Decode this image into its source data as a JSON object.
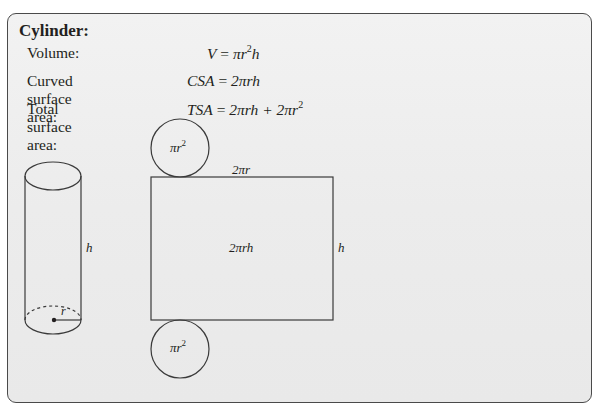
{
  "title": "Cylinder:",
  "formulas": [
    {
      "label": "Volume:",
      "lhs": "V",
      "eq": " = ",
      "rhs_a": "πr",
      "sup": "2",
      "rhs_b": "h",
      "tail": "",
      "tail_sup": ""
    },
    {
      "label": "Curved surface area:",
      "lhs": "CSA",
      "eq": " = ",
      "rhs_a": "2πrh",
      "sup": "",
      "rhs_b": "",
      "tail": "",
      "tail_sup": ""
    },
    {
      "label": "Total surface area:",
      "lhs": "TSA",
      "eq": " = ",
      "rhs_a": "2πrh + 2πr",
      "sup": "2",
      "rhs_b": "",
      "tail": "",
      "tail_sup": ""
    }
  ],
  "diagram": {
    "cylinder": {
      "height_label": "h",
      "radius_label": "r"
    },
    "net": {
      "top_circle_label": "πr",
      "top_circle_sup": "2",
      "bottom_circle_label": "πr",
      "bottom_circle_sup": "2",
      "rect_width_label": "2πr",
      "rect_area_label": "2πrh",
      "rect_height_label": "h"
    }
  },
  "colors": {
    "line": "#3a3a3a",
    "panel": "#ececec",
    "border": "#4a4a4a"
  }
}
